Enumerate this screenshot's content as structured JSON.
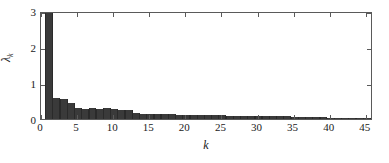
{
  "chart_data": {
    "type": "bar",
    "title": "",
    "subtitle": "",
    "xlabel": "k",
    "ylabel": "λ",
    "ylabel_subscript": "k",
    "xlim": [
      0,
      46
    ],
    "ylim": [
      0,
      3
    ],
    "grid": false,
    "legend": null,
    "bar_color": "#3a3a3a",
    "axis_color": "#5a5a5a",
    "note": "First bar is clipped by the axis limit; its true value exceeds 3.",
    "xticks": [
      0,
      5,
      10,
      15,
      20,
      25,
      30,
      35,
      40,
      45
    ],
    "xtick_labels": [
      "0",
      "5",
      "10",
      "15",
      "20",
      "25",
      "30",
      "35",
      "40",
      "45"
    ],
    "yticks": [
      0,
      1,
      2,
      3
    ],
    "ytick_labels": [
      "0",
      "1",
      "2",
      "3"
    ],
    "x": [
      1,
      2,
      3,
      4,
      5,
      6,
      7,
      8,
      9,
      10,
      11,
      12,
      13,
      14,
      15,
      16,
      17,
      18,
      19,
      20,
      21,
      22,
      23,
      24,
      25,
      26,
      27,
      28,
      29,
      30,
      31,
      32,
      33,
      34,
      35,
      36,
      37,
      38,
      39,
      40,
      41,
      42,
      43,
      44,
      45
    ],
    "values": [
      3.12,
      0.57,
      0.56,
      0.45,
      0.3,
      0.29,
      0.3,
      0.29,
      0.3,
      0.27,
      0.26,
      0.26,
      0.16,
      0.15,
      0.15,
      0.14,
      0.14,
      0.13,
      0.12,
      0.12,
      0.11,
      0.11,
      0.1,
      0.1,
      0.1,
      0.09,
      0.09,
      0.09,
      0.08,
      0.08,
      0.08,
      0.07,
      0.07,
      0.07,
      0.06,
      0.06,
      0.06,
      0.05,
      0.05,
      0.04,
      0.04,
      0.03,
      0.02,
      0.02,
      0.01
    ]
  }
}
